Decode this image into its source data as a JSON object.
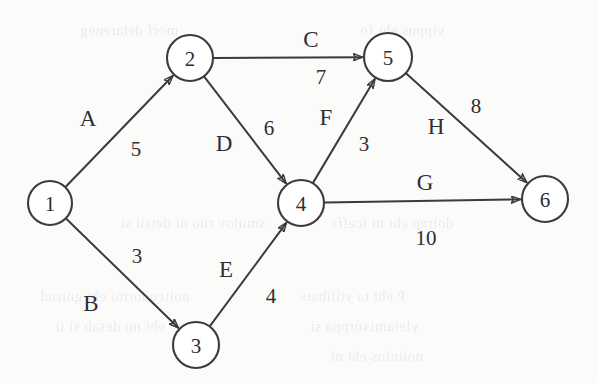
{
  "diagram": {
    "type": "directed-weighted-graph",
    "title": "",
    "colors": {
      "stroke": "#3a3a40",
      "text": "#2e2e33",
      "background": "#fbfbfa"
    },
    "nodes": [
      {
        "id": "1",
        "label": "1",
        "cx": 50,
        "cy": 203,
        "r": 22
      },
      {
        "id": "2",
        "label": "2",
        "cx": 190,
        "cy": 58,
        "r": 23
      },
      {
        "id": "3",
        "label": "3",
        "cx": 196,
        "cy": 345,
        "r": 23
      },
      {
        "id": "4",
        "label": "4",
        "cx": 301,
        "cy": 203,
        "r": 23
      },
      {
        "id": "5",
        "label": "5",
        "cx": 388,
        "cy": 57,
        "r": 24
      },
      {
        "id": "6",
        "label": "6",
        "cx": 545,
        "cy": 199,
        "r": 23
      }
    ],
    "edges": [
      {
        "id": "A",
        "name": "A",
        "weight": "5",
        "from": "1",
        "to": "2",
        "name_x": 88,
        "name_y": 118,
        "weight_x": 136,
        "weight_y": 149
      },
      {
        "id": "B",
        "name": "B",
        "weight": "3",
        "from": "1",
        "to": "3",
        "name_x": 91,
        "name_y": 303,
        "weight_x": 137,
        "weight_y": 256
      },
      {
        "id": "C",
        "name": "C",
        "weight": "7",
        "from": "2",
        "to": "5",
        "name_x": 311,
        "name_y": 39,
        "weight_x": 321,
        "weight_y": 77
      },
      {
        "id": "D",
        "name": "D",
        "weight": "6",
        "from": "2",
        "to": "4",
        "name_x": 224,
        "name_y": 143,
        "weight_x": 269,
        "weight_y": 128
      },
      {
        "id": "E",
        "name": "E",
        "weight": "4",
        "from": "3",
        "to": "4",
        "name_x": 226,
        "name_y": 269,
        "weight_x": 271,
        "weight_y": 296
      },
      {
        "id": "F",
        "name": "F",
        "weight": "3",
        "from": "4",
        "to": "5",
        "name_x": 326,
        "name_y": 117,
        "weight_x": 364,
        "weight_y": 144
      },
      {
        "id": "G",
        "name": "G",
        "weight": "10",
        "from": "4",
        "to": "6",
        "name_x": 425,
        "name_y": 182,
        "weight_x": 426,
        "weight_y": 238
      },
      {
        "id": "H",
        "name": "H",
        "weight": "8",
        "from": "5",
        "to": "6",
        "name_x": 436,
        "name_y": 126,
        "weight_x": 476,
        "weight_y": 106
      }
    ],
    "background_bleed": [
      {
        "text": "smulov ruo ni detsil si",
        "x": 120,
        "y": 215
      },
      {
        "text": "doirep eht ni tceffe",
        "x": 330,
        "y": 215
      },
      {
        "text": "noitcudortni eht gnirud",
        "x": 40,
        "y": 288
      },
      {
        "text": "P eht ta ytilibats",
        "x": 300,
        "y": 288
      },
      {
        "text": "eht no desab si ti",
        "x": 55,
        "y": 318
      },
      {
        "text": "yletamixorppa si",
        "x": 310,
        "y": 318
      },
      {
        "text": "noitulos eht ni",
        "x": 330,
        "y": 348
      },
      {
        "text": "morf detareneg",
        "x": 80,
        "y": 22
      },
      {
        "text": "ylppus eht fo",
        "x": 360,
        "y": 22
      }
    ]
  }
}
